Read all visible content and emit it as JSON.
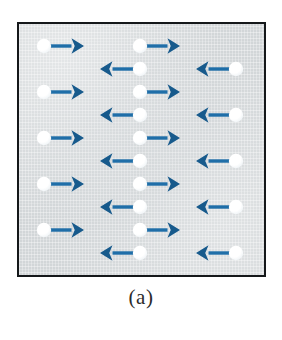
{
  "figure": {
    "caption": "(a)",
    "panel": {
      "background_color": "#d2d6d8",
      "border_color": "#15181a",
      "x": 17,
      "y": 22,
      "width": 249,
      "height": 255
    },
    "legend_colors": {
      "arrow_blue": "#1f6ea8",
      "arrow_blue_dark": "#175a8c",
      "atom_white": "#ffffff"
    },
    "columns": [
      {
        "name": "left-column",
        "direction_pattern": "all-right",
        "spins": [
          {
            "id": "L1",
            "x": 44,
            "y": 46,
            "direction": "right"
          },
          {
            "id": "L2",
            "x": 44,
            "y": 92,
            "direction": "right"
          },
          {
            "id": "L3",
            "x": 44,
            "y": 138,
            "direction": "right"
          },
          {
            "id": "L4",
            "x": 44,
            "y": 184,
            "direction": "right"
          },
          {
            "id": "L5",
            "x": 44,
            "y": 230,
            "direction": "right"
          }
        ]
      },
      {
        "name": "center-column",
        "direction_pattern": "alternating",
        "spins": [
          {
            "id": "C1",
            "x": 140,
            "y": 46,
            "direction": "right"
          },
          {
            "id": "C2",
            "x": 140,
            "y": 69,
            "direction": "left"
          },
          {
            "id": "C3",
            "x": 140,
            "y": 92,
            "direction": "right"
          },
          {
            "id": "C4",
            "x": 140,
            "y": 115,
            "direction": "left"
          },
          {
            "id": "C5",
            "x": 140,
            "y": 138,
            "direction": "right"
          },
          {
            "id": "C6",
            "x": 140,
            "y": 161,
            "direction": "left"
          },
          {
            "id": "C7",
            "x": 140,
            "y": 184,
            "direction": "right"
          },
          {
            "id": "C8",
            "x": 140,
            "y": 207,
            "direction": "left"
          },
          {
            "id": "C9",
            "x": 140,
            "y": 230,
            "direction": "right"
          },
          {
            "id": "C10",
            "x": 140,
            "y": 253,
            "direction": "left"
          }
        ]
      },
      {
        "name": "right-column",
        "direction_pattern": "all-left",
        "spins": [
          {
            "id": "R1",
            "x": 236,
            "y": 69,
            "direction": "left"
          },
          {
            "id": "R2",
            "x": 236,
            "y": 115,
            "direction": "left"
          },
          {
            "id": "R3",
            "x": 236,
            "y": 161,
            "direction": "left"
          },
          {
            "id": "R4",
            "x": 236,
            "y": 207,
            "direction": "left"
          },
          {
            "id": "R5",
            "x": 236,
            "y": 253,
            "direction": "left"
          }
        ]
      }
    ]
  }
}
